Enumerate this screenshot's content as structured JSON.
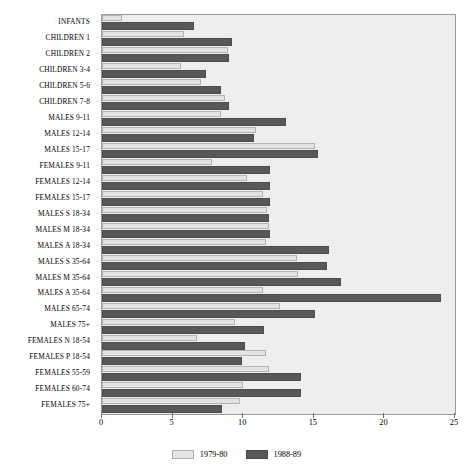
{
  "chart_data": {
    "type": "bar",
    "orientation": "horizontal",
    "title": "",
    "subtitle": "",
    "xlabel": "",
    "ylabel": "",
    "xlim": [
      0,
      25
    ],
    "xticks": [
      0,
      5,
      10,
      15,
      20,
      25
    ],
    "xtick_labels": [
      "0",
      "5",
      "10",
      "15",
      "20",
      "25"
    ],
    "grid": false,
    "legend_position": "bottom",
    "categories": [
      "INFANTS",
      "CHILDREN 1",
      "CHILDREN 2",
      "CHILDREN 3-4",
      "CHILDREN 5-6",
      "CHILDREN 7-8",
      "MALES 9-11",
      "MALES 12-14",
      "MALES 15-17",
      "FEMALES 9-11",
      "FEMALES 12-14",
      "FEMALES 15-17",
      "MALES S 18-34",
      "MALES M 18-34",
      "MALES A 18-34",
      "MALES S 35-64",
      "MALES M 35-64",
      "MALES A 35-64",
      "MALES 65-74",
      "MALES 75+",
      "FEMALES N 18-54",
      "FEMALES P 18-54",
      "FEMALES 55-59",
      "FEMALES 60-74",
      "FEMALES 75+"
    ],
    "series": [
      {
        "name": "1979-80",
        "color": "#e3e3e3",
        "values": [
          1.4,
          5.8,
          8.9,
          5.6,
          7.0,
          8.7,
          8.4,
          10.9,
          15.1,
          7.8,
          10.3,
          11.4,
          11.7,
          11.8,
          11.6,
          13.8,
          13.9,
          11.4,
          12.6,
          9.4,
          6.7,
          11.6,
          11.8,
          10.0,
          9.8
        ]
      },
      {
        "name": "1988-89",
        "color": "#585858",
        "values": [
          6.5,
          9.2,
          9.0,
          7.4,
          8.4,
          9.0,
          13.0,
          10.8,
          15.3,
          11.9,
          11.9,
          11.9,
          11.8,
          11.9,
          16.1,
          15.9,
          16.9,
          24.0,
          15.1,
          11.5,
          10.1,
          9.9,
          14.1,
          14.1,
          8.5
        ]
      }
    ]
  },
  "legend": {
    "items": [
      {
        "label": "1979-80",
        "swatch": "light"
      },
      {
        "label": "1988-89",
        "swatch": "dark"
      }
    ]
  }
}
